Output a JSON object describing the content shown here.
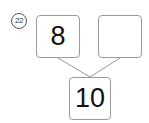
{
  "problem": {
    "number_label": "22",
    "left_part": "8",
    "right_part": "",
    "whole": "10"
  }
}
